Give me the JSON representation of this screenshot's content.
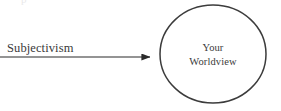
{
  "diagram": {
    "type": "flow-diagram",
    "background_color": "#ffffff",
    "canvas": {
      "width": 281,
      "height": 111
    },
    "ghost_text": {
      "text": "p",
      "note": "faint clipped text remnant at top edge",
      "color": "#d8d8d8"
    },
    "source": {
      "label": "Subjectivism",
      "color": "#3a3a3a",
      "x": 7,
      "y": 52
    },
    "connector": {
      "name": "arrow",
      "style": "solid-line-with-filled-arrowhead",
      "color": "#2b2b2b",
      "stroke_width": 1.1,
      "from_x": 0,
      "to_x": 158,
      "y": 57
    },
    "node": {
      "shape": "circle",
      "label_line_1": "Your",
      "label_line_2": "Worldview",
      "outline_color": "#3c3c3c",
      "fill_color": "none",
      "stroke_width": 1.5,
      "center_x": 213,
      "center_y": 54,
      "radius_x": 53,
      "radius_y": 49
    }
  }
}
